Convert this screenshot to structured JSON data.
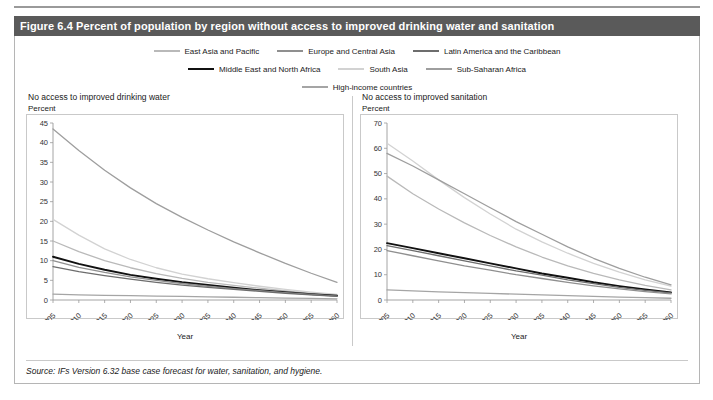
{
  "figure": {
    "caption": "Figure 6.4 Percent of population by region without access to improved drinking water and sanitation",
    "source": "Source: IFs Version 6.32 base case forecast for water, sanitation, and hygiene."
  },
  "legend": {
    "rows": [
      [
        {
          "label": "East Asia and Pacific",
          "color": "#b9b9b9"
        },
        {
          "label": "Europe and Central Asia",
          "color": "#8f8f8f"
        },
        {
          "label": "Latin America and the Caribbean",
          "color": "#6d6d6d"
        }
      ],
      [
        {
          "label": "Middle East and North Africa",
          "color": "#111111"
        },
        {
          "label": "South Asia",
          "color": "#d2d2d2"
        },
        {
          "label": "Sub-Saharan Africa",
          "color": "#9e9e9e"
        }
      ],
      [
        {
          "label": "High-income countries",
          "color": "#a5a5a5"
        }
      ]
    ]
  },
  "chart_data": [
    {
      "type": "line",
      "title": "No access to improved drinking water",
      "ylabel": "Percent",
      "xlabel": "Year",
      "xlim": [
        2005,
        2060
      ],
      "ylim": [
        0,
        45
      ],
      "yticks": [
        0,
        5,
        10,
        15,
        20,
        25,
        30,
        35,
        40,
        45
      ],
      "xticks": [
        2005,
        2010,
        2015,
        2020,
        2025,
        2030,
        2035,
        2040,
        2045,
        2050,
        2055,
        2060
      ],
      "x": [
        2005,
        2010,
        2015,
        2020,
        2025,
        2030,
        2035,
        2040,
        2045,
        2050,
        2055,
        2060
      ],
      "grid": false,
      "legend_position": "top",
      "series": [
        {
          "name": "Sub-Saharan Africa",
          "color": "#9e9e9e",
          "values": [
            43.5,
            38.0,
            33.0,
            28.5,
            24.5,
            21.0,
            17.8,
            14.8,
            12.0,
            9.3,
            6.8,
            4.5
          ]
        },
        {
          "name": "South Asia",
          "color": "#d2d2d2",
          "values": [
            20.5,
            16.5,
            13.0,
            10.3,
            8.2,
            6.6,
            5.4,
            4.4,
            3.5,
            2.7,
            2.0,
            1.4
          ]
        },
        {
          "name": "East Asia and Pacific",
          "color": "#b9b9b9",
          "values": [
            15.0,
            12.3,
            10.0,
            8.2,
            6.7,
            5.5,
            4.5,
            3.7,
            3.0,
            2.3,
            1.7,
            1.2
          ]
        },
        {
          "name": "Middle East and North Africa",
          "color": "#111111",
          "values": [
            11.0,
            9.2,
            7.7,
            6.4,
            5.4,
            4.5,
            3.8,
            3.1,
            2.5,
            2.0,
            1.5,
            1.1
          ]
        },
        {
          "name": "Europe and Central Asia",
          "color": "#8f8f8f",
          "values": [
            10.0,
            8.3,
            7.0,
            5.9,
            5.0,
            4.2,
            3.5,
            2.9,
            2.4,
            1.9,
            1.4,
            1.0
          ]
        },
        {
          "name": "Latin America and the Caribbean",
          "color": "#6d6d6d",
          "values": [
            8.5,
            7.2,
            6.2,
            5.3,
            4.5,
            3.8,
            3.2,
            2.7,
            2.2,
            1.7,
            1.3,
            0.9
          ]
        },
        {
          "name": "High-income countries",
          "color": "#a5a5a5",
          "values": [
            1.5,
            1.3,
            1.2,
            1.1,
            1.0,
            0.9,
            0.8,
            0.7,
            0.6,
            0.5,
            0.4,
            0.3
          ]
        }
      ]
    },
    {
      "type": "line",
      "title": "No access to improved sanitation",
      "ylabel": "Percent",
      "xlabel": "Year",
      "xlim": [
        2005,
        2060
      ],
      "ylim": [
        0,
        70
      ],
      "yticks": [
        0,
        10,
        20,
        30,
        40,
        50,
        60,
        70
      ],
      "xticks": [
        2005,
        2010,
        2015,
        2020,
        2025,
        2030,
        2035,
        2040,
        2045,
        2050,
        2055,
        2060
      ],
      "x": [
        2005,
        2010,
        2015,
        2020,
        2025,
        2030,
        2035,
        2040,
        2045,
        2050,
        2055,
        2060
      ],
      "grid": false,
      "legend_position": "top",
      "series": [
        {
          "name": "South Asia",
          "color": "#d2d2d2",
          "values": [
            62.0,
            55.0,
            47.5,
            40.5,
            34.0,
            28.0,
            23.0,
            18.5,
            14.5,
            11.0,
            8.0,
            5.5
          ]
        },
        {
          "name": "Sub-Saharan Africa",
          "color": "#9e9e9e",
          "values": [
            58.0,
            53.0,
            47.5,
            42.0,
            36.5,
            31.0,
            26.0,
            21.0,
            16.5,
            12.5,
            9.0,
            6.0
          ]
        },
        {
          "name": "East Asia and Pacific",
          "color": "#b9b9b9",
          "values": [
            49.0,
            42.0,
            36.0,
            30.5,
            25.5,
            21.0,
            17.0,
            13.5,
            10.5,
            8.0,
            5.8,
            4.0
          ]
        },
        {
          "name": "Middle East and North Africa",
          "color": "#111111",
          "values": [
            22.5,
            20.5,
            18.5,
            16.5,
            14.5,
            12.5,
            10.5,
            8.8,
            7.0,
            5.5,
            4.2,
            3.0
          ]
        },
        {
          "name": "Latin America and the Caribbean",
          "color": "#6d6d6d",
          "values": [
            21.5,
            19.5,
            17.5,
            15.5,
            13.5,
            11.5,
            9.8,
            8.0,
            6.5,
            5.0,
            3.8,
            2.8
          ]
        },
        {
          "name": "Europe and Central Asia",
          "color": "#8f8f8f",
          "values": [
            19.5,
            17.5,
            15.5,
            13.5,
            11.8,
            10.0,
            8.5,
            7.0,
            5.6,
            4.4,
            3.3,
            2.4
          ]
        },
        {
          "name": "High-income countries",
          "color": "#a5a5a5",
          "values": [
            4.0,
            3.6,
            3.2,
            2.9,
            2.6,
            2.3,
            2.0,
            1.7,
            1.4,
            1.1,
            0.9,
            0.7
          ]
        }
      ]
    }
  ]
}
